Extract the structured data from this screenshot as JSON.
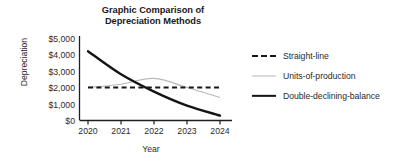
{
  "chart_data": {
    "type": "line",
    "title": "Graphic Comparison of Depreciation Methods",
    "title_line1": "Graphic Comparison of",
    "title_line2": "Depreciation Methods",
    "xlabel": "Year",
    "ylabel": "Depreciation",
    "x": [
      2020,
      2021,
      2022,
      2023,
      2024
    ],
    "xtick_labels": [
      "2020",
      "2021",
      "2022",
      "2023",
      "2024"
    ],
    "ytick_labels": [
      "$5,000",
      "$4,000",
      "$3,000",
      "$2,000",
      "$1,000",
      "$0"
    ],
    "ytick_values": [
      5000,
      4000,
      3000,
      2000,
      1000,
      0
    ],
    "ylim": [
      0,
      5000
    ],
    "xlim": [
      2020,
      2024
    ],
    "grid": false,
    "legend_position": "right",
    "series": [
      {
        "name": "Straight-line",
        "style": "dashed",
        "color": "#171717",
        "values": [
          2000,
          2000,
          2000,
          2000,
          2000
        ]
      },
      {
        "name": "Units-of-production",
        "style": "solid-thin",
        "color": "#b9b9b9",
        "values": [
          2000,
          2200,
          2550,
          2000,
          1400
        ]
      },
      {
        "name": "Double-declining-balance",
        "style": "solid-thick",
        "color": "#141414",
        "values": [
          4200,
          2800,
          1750,
          900,
          300
        ]
      }
    ]
  },
  "colors": {
    "straight_line": "#171717",
    "units_of_production": "#b9b9b9",
    "double_declining": "#141414",
    "axis": "#1f1f1f",
    "text": "#2b2b2b",
    "background": "#ffffff"
  }
}
